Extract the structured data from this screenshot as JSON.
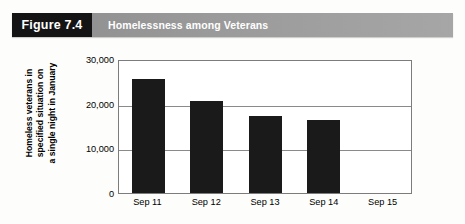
{
  "header": {
    "figure_number": "Figure 7.4",
    "title": "Homelessness among Veterans",
    "number_box_color": "#141414",
    "band_color": "#9a9a9a",
    "text_color": "#ffffff"
  },
  "chart_data": {
    "type": "bar",
    "title": "Homelessness among Veterans",
    "categories": [
      "Sep 11",
      "Sep 12",
      "Sep 13",
      "Sep 14",
      "Sep 15"
    ],
    "values": [
      26000,
      21000,
      17500,
      16500,
      null
    ],
    "xlabel": "",
    "ylabel": "Homeless veterans in specified situation on a single night in January",
    "ylabel_lines": [
      "Homeless veterans in",
      "specified situation on",
      "a single night in January"
    ],
    "ylim": [
      0,
      30000
    ],
    "ytick_values": [
      30000,
      20000,
      10000,
      0
    ],
    "ytick_labels": [
      "30,000",
      "20,000",
      "10,000",
      "0"
    ],
    "grid": true,
    "grid_axis": "y",
    "legend": false,
    "bar_color": "#1a1a1a",
    "plot_background": "#ffffff",
    "axis_color": "#7c7c7c"
  }
}
